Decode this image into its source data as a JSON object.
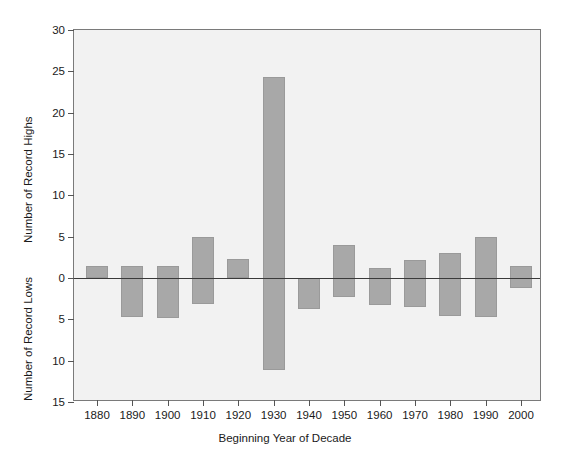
{
  "chart_data": {
    "type": "bar",
    "title": "",
    "xlabel": "Beginning Year of Decade",
    "ylabel_upper": "Number of Record Highs",
    "ylabel_lower": "Number of Record Lows",
    "categories": [
      1880,
      1890,
      1900,
      1910,
      1920,
      1930,
      1940,
      1950,
      1960,
      1970,
      1980,
      1990,
      2000
    ],
    "xtick_labels": [
      "1880",
      "1890",
      "1900",
      "1910",
      "1920",
      "1930",
      "1940",
      "1950",
      "1960",
      "1970",
      "1980",
      "1990",
      "2000"
    ],
    "series": [
      {
        "name": "Number of Record Highs",
        "direction": "up",
        "values": [
          1.5,
          1.5,
          1.5,
          5.0,
          2.3,
          24.3,
          0.0,
          4.0,
          1.2,
          2.2,
          3.0,
          5.0,
          1.5
        ]
      },
      {
        "name": "Number of Record Lows",
        "direction": "down",
        "values": [
          0.0,
          4.7,
          4.8,
          3.2,
          0.0,
          11.1,
          3.7,
          2.3,
          3.3,
          3.5,
          4.6,
          4.7,
          1.2
        ]
      }
    ],
    "yticks_upper": [
      0,
      5,
      10,
      15,
      20,
      25,
      30
    ],
    "yticks_upper_labels": [
      "0",
      "5",
      "10",
      "15",
      "20",
      "25",
      "30"
    ],
    "yticks_lower": [
      5,
      10,
      15
    ],
    "yticks_lower_labels": [
      "5",
      "10",
      "15"
    ],
    "ylim_upper": 30,
    "ylim_lower": 15,
    "grid": false,
    "legend": "none",
    "bar_color": "#a8a8a8",
    "plot_background": "#f2f2f2",
    "axis_color": "#555555",
    "zero_line_color": "#3a3a3a"
  }
}
